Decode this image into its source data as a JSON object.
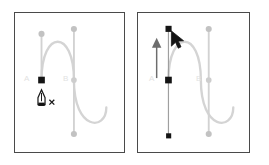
{
  "figure": {
    "caption": "",
    "panels": [
      {
        "id": "before",
        "name": "before-drag",
        "label_a": "A",
        "label_b": "B",
        "cursor_icon": "pen-tool-cursor-with-x",
        "path_color": "#d0d0d0",
        "handle_line_color": "#cfcfcf",
        "handle_dot_color": "#c4c4c4",
        "anchor_color": "#1a1a1a",
        "label_color": "#e2e2e2",
        "border_color": "#4a4a4a",
        "direction_handle_a": {
          "top_handle_y": 33,
          "anchor_y": 80,
          "x": 41,
          "top_dot_style": "circle-gray",
          "anchor_style": "square-black"
        },
        "direction_handle_b": {
          "top_handle_y": 28,
          "anchor_y": 80,
          "bottom_handle_y": 135,
          "x": 74,
          "top_dot_style": "circle-gray",
          "anchor_style": "circle-gray",
          "bottom_dot_style": "circle-gray"
        }
      },
      {
        "id": "after",
        "name": "after-drag",
        "label_a": "A",
        "label_b": "B",
        "cursor_icon": "arrow-pointer-cursor",
        "annotation_icon": "up-arrow",
        "path_color": "#d0d0d0",
        "handle_line_color": "#9a9a9a",
        "handle_dot_color": "#c4c4c4",
        "anchor_color": "#1a1a1a",
        "label_color": "#e2e2e2",
        "border_color": "#4a4a4a",
        "direction_handle_a": {
          "top_handle_y": 28,
          "anchor_y": 80,
          "bottom_handle_y": 137,
          "x": 170,
          "top_dot_style": "square-black",
          "anchor_style": "square-black",
          "bottom_dot_style": "square-black"
        },
        "direction_handle_b": {
          "top_handle_y": 28,
          "anchor_y": 80,
          "bottom_handle_y": 135,
          "x": 209,
          "top_dot_style": "circle-gray",
          "anchor_style": "circle-gray",
          "bottom_dot_style": "circle-gray"
        }
      }
    ]
  }
}
